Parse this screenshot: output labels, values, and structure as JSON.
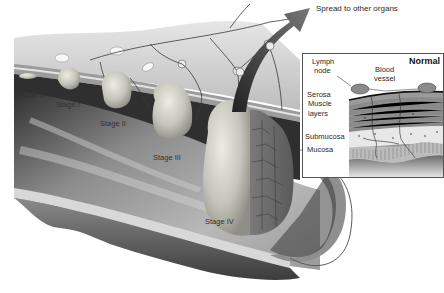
{
  "diagram": {
    "callout": "Spread to other organs",
    "stages": [
      {
        "label": "Stage 0"
      },
      {
        "label": "Stage I"
      },
      {
        "label": "Stage II"
      },
      {
        "label": "Stage III"
      },
      {
        "label": "Stage IV"
      }
    ],
    "inset": {
      "title": "Normal",
      "labels": {
        "lymph_node": "Lymph\nnode",
        "lymph_node_l1": "Lymph",
        "lymph_node_l2": "node",
        "blood_vessel_l1": "Blood",
        "blood_vessel_l2": "vessel"
      }
    },
    "layers": [
      {
        "label": "Serosa"
      },
      {
        "label": "Muscle"
      },
      {
        "label": "layers"
      },
      {
        "label": "Submucosa"
      },
      {
        "label": "Mucosa"
      }
    ]
  },
  "colors": {
    "background": "#ffffff",
    "tissue_light": "#d9d9d9",
    "tissue_mid": "#a8a8a8",
    "tissue_dark": "#4a4a4a",
    "tumor": "#cfcfc6",
    "text": "#2a2a2a"
  }
}
